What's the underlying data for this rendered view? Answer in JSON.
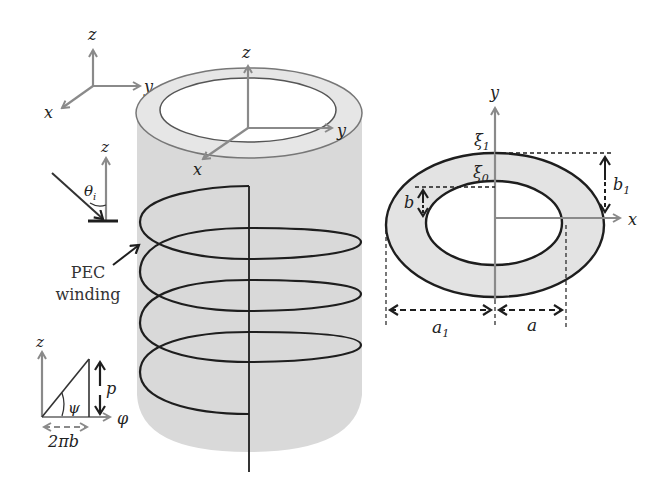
{
  "figure": {
    "colors": {
      "background": "#ffffff",
      "cylinder_fill": "#d9d9d9",
      "ring_fill": "#e6e6e6",
      "axis_gray": "#8a8a8a",
      "line_black": "#1e1e1e"
    },
    "global_axes": {
      "z": "z",
      "y": "y",
      "x": "x"
    },
    "incidence": {
      "axis_label": "z",
      "angle_label": "θ",
      "angle_sub": "i"
    },
    "cylinder_axes": {
      "z": "z",
      "y": "y",
      "x": "x"
    },
    "winding_label": {
      "line1": "PEC",
      "line2": "winding"
    },
    "pitch_inset": {
      "z": "z",
      "phi": "φ",
      "psi": "ψ",
      "p": "p",
      "base": "2πb"
    },
    "cross_section": {
      "y": "y",
      "x": "x",
      "xi1": "ξ",
      "xi1_sub": "1",
      "xi0": "ξ",
      "xi0_sub": "0",
      "b": "b",
      "b1": "b",
      "b1_sub": "1",
      "a1": "a",
      "a1_sub": "1",
      "a": "a"
    }
  }
}
